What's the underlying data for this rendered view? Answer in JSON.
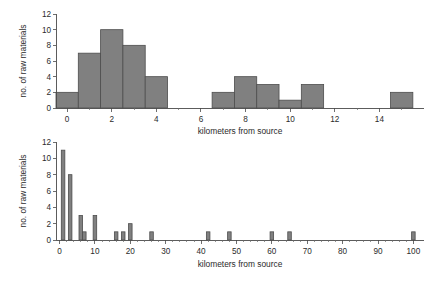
{
  "figure": {
    "background_color": "#ffffff",
    "bar_fill_color": "#808080",
    "bar_edge_color": "#4d4d4d",
    "axis_color": "#4a4a4a",
    "text_color": "#2b2b2b"
  },
  "chart_data": [
    {
      "id": "top-histogram",
      "type": "bar",
      "title": "",
      "xlabel": "kilometers from source",
      "ylabel": "no. of raw materials",
      "xlim": [
        -0.5,
        16.0
      ],
      "ylim": [
        0,
        12
      ],
      "grid": false,
      "legend": null,
      "xticks": [
        0,
        2,
        4,
        6,
        8,
        10,
        12,
        14
      ],
      "xticklabels": [
        "0",
        "2",
        "4",
        "6",
        "8",
        "10",
        "12",
        "14"
      ],
      "xticks_minor": [
        1,
        3,
        5,
        7,
        9,
        11,
        13,
        15
      ],
      "yticks": [
        0,
        2,
        4,
        6,
        8,
        10,
        12
      ],
      "yticklabels": [
        "0",
        "2",
        "4",
        "6",
        "8",
        "10",
        "12"
      ],
      "bin_width": 1,
      "bins": [
        {
          "left": -0.5,
          "right": 0.5,
          "center": 0,
          "value": 2
        },
        {
          "left": 0.5,
          "right": 1.5,
          "center": 1,
          "value": 7
        },
        {
          "left": 1.5,
          "right": 2.5,
          "center": 2,
          "value": 10
        },
        {
          "left": 2.5,
          "right": 3.5,
          "center": 3,
          "value": 8
        },
        {
          "left": 3.5,
          "right": 4.5,
          "center": 4,
          "value": 4
        },
        {
          "left": 4.5,
          "right": 5.5,
          "center": 5,
          "value": 0
        },
        {
          "left": 5.5,
          "right": 6.5,
          "center": 6,
          "value": 0
        },
        {
          "left": 6.5,
          "right": 7.5,
          "center": 7,
          "value": 2
        },
        {
          "left": 7.5,
          "right": 8.5,
          "center": 8,
          "value": 4
        },
        {
          "left": 8.5,
          "right": 9.5,
          "center": 9,
          "value": 3
        },
        {
          "left": 9.5,
          "right": 10.5,
          "center": 10,
          "value": 1
        },
        {
          "left": 10.5,
          "right": 11.5,
          "center": 11,
          "value": 3
        },
        {
          "left": 11.5,
          "right": 12.5,
          "center": 12,
          "value": 0
        },
        {
          "left": 12.5,
          "right": 13.5,
          "center": 13,
          "value": 0
        },
        {
          "left": 13.5,
          "right": 14.5,
          "center": 14,
          "value": 0
        },
        {
          "left": 14.5,
          "right": 15.5,
          "center": 15,
          "value": 2
        }
      ]
    },
    {
      "id": "bottom-histogram",
      "type": "bar",
      "title": "",
      "xlabel": "kilometers from source",
      "ylabel": "no. of raw materials",
      "xlim": [
        -1,
        103
      ],
      "ylim": [
        0,
        12
      ],
      "grid": false,
      "legend": null,
      "xticks": [
        0,
        10,
        20,
        30,
        40,
        50,
        60,
        70,
        80,
        90,
        100
      ],
      "xticklabels": [
        "0",
        "10",
        "20",
        "30",
        "40",
        "50",
        "60",
        "70",
        "80",
        "90",
        "100"
      ],
      "yticks": [
        0,
        2,
        4,
        6,
        8,
        10,
        12
      ],
      "yticklabels": [
        "0",
        "2",
        "4",
        "6",
        "8",
        "10",
        "12"
      ],
      "bin_width": 1,
      "bins": [
        {
          "center": 1,
          "value": 11
        },
        {
          "center": 3,
          "value": 8
        },
        {
          "center": 6,
          "value": 3
        },
        {
          "center": 7,
          "value": 1
        },
        {
          "center": 10,
          "value": 3
        },
        {
          "center": 16,
          "value": 1
        },
        {
          "center": 18,
          "value": 1
        },
        {
          "center": 20,
          "value": 2
        },
        {
          "center": 26,
          "value": 1
        },
        {
          "center": 42,
          "value": 1
        },
        {
          "center": 48,
          "value": 1
        },
        {
          "center": 60,
          "value": 1
        },
        {
          "center": 65,
          "value": 1
        },
        {
          "center": 100,
          "value": 1
        }
      ]
    }
  ]
}
